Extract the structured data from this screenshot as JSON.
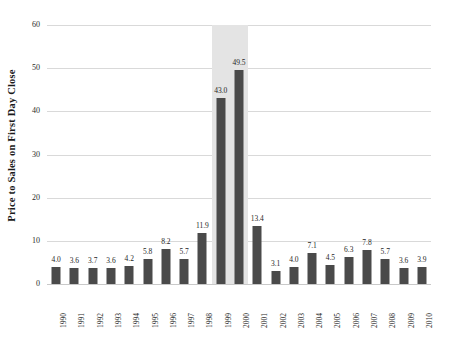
{
  "chart_data": {
    "type": "bar",
    "title": "",
    "subtitle": "",
    "xlabel": "",
    "ylabel": "Price to Sales on First Day Close",
    "ylim": [
      0,
      60
    ],
    "yticks": [
      0,
      10,
      20,
      30,
      40,
      50,
      60
    ],
    "ytick_labels": [
      "0",
      "10",
      "20",
      "30",
      "40",
      "50",
      "60"
    ],
    "grid": "horizontal",
    "legend": "none",
    "bar_color": "#4a4a4a",
    "gridline_color": "#d9d9d9",
    "highlight": {
      "label": "bubble-years-highlight",
      "color": "#e4e4e4",
      "from_category": "1999",
      "to_category": "2000"
    },
    "categories": [
      "1990",
      "1991",
      "1992",
      "1993",
      "1994",
      "1995",
      "1996",
      "1997",
      "1998",
      "1999",
      "2000",
      "2001",
      "2002",
      "2003",
      "2004",
      "2005",
      "2006",
      "2007",
      "2008",
      "2009",
      "2010"
    ],
    "values": [
      4.0,
      3.6,
      3.7,
      3.6,
      4.2,
      5.8,
      8.2,
      5.7,
      11.9,
      43.0,
      49.5,
      13.4,
      3.1,
      4.0,
      7.1,
      4.5,
      6.3,
      7.8,
      5.7,
      3.6,
      3.9
    ],
    "data_labels": [
      "4.0",
      "3.6",
      "3.7",
      "3.6",
      "4.2",
      "5.8",
      "8.2",
      "5.7",
      "11.9",
      "43.0",
      "49.5",
      "13.4",
      "3.1",
      "4.0",
      "7.1",
      "4.5",
      "6.3",
      "7.8",
      "5.7",
      "3.6",
      "3.9"
    ]
  }
}
